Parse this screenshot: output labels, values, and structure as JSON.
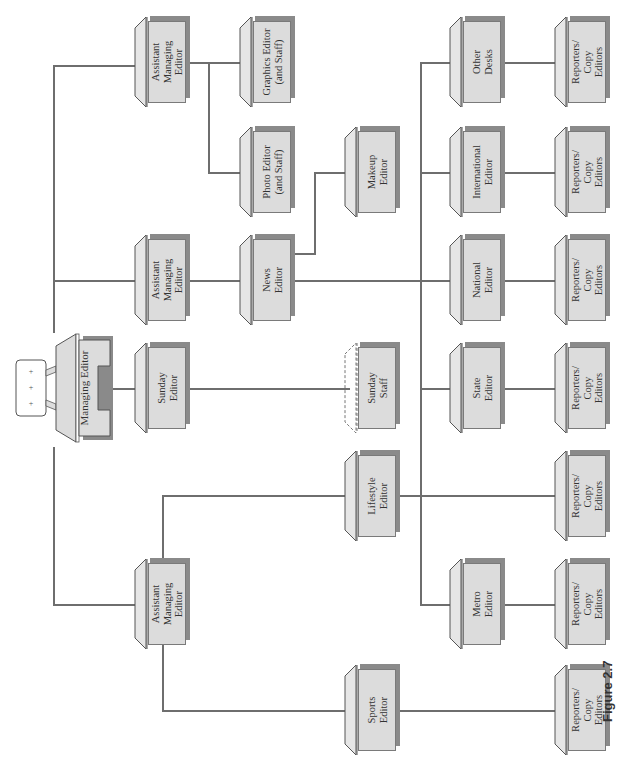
{
  "diagram": {
    "type": "org-chart",
    "orientation": "rotated-90-ccw",
    "figure_label": "Figure 2.7",
    "root": {
      "id": "managing-editor",
      "label": "Managing Editor",
      "icon": "desk-with-typewriter-icon"
    },
    "nodes": {
      "ame_top": "Assistant\nManaging\nEditor",
      "graphics": "Graphics Editor\n(and Staff)",
      "photo": "Photo Editor\n(and Staff)",
      "ame_mid": "Assistant\nManaging\nEditor",
      "news": "News\nEditor",
      "makeup": "Makeup\nEditor",
      "other_desks": "Other\nDesks",
      "international": "International\nEditor",
      "national": "National\nEditor",
      "state": "State\nEditor",
      "metro": "Metro\nEditor",
      "sunday": "Sunday\nEditor",
      "sunday_staff": "Sunday\nStaff",
      "ame_bot": "Assistant\nManaging\nEditor",
      "lifestyle": "Lifestyle\nEditor",
      "sports": "Sports\nEditor",
      "rep_other": "Reporters/\nCopy\nEditors",
      "rep_international": "Reporters/\nCopy\nEditors",
      "rep_national": "Reporters/\nCopy\nEditors",
      "rep_state": "Reporters/\nCopy\nEditors",
      "rep_lifestyle": "Reporters/\nCopy\nEditors",
      "rep_metro": "Reporters/\nCopy\nEditors",
      "rep_sports": "Reporters/\nCopy\nEditors"
    },
    "edges": [
      [
        "Managing Editor",
        "Assistant Managing Editor (top)"
      ],
      [
        "Managing Editor",
        "Assistant Managing Editor (middle)"
      ],
      [
        "Managing Editor",
        "Sunday Editor"
      ],
      [
        "Managing Editor",
        "Assistant Managing Editor (bottom)"
      ],
      [
        "Assistant Managing Editor (top)",
        "Graphics Editor (and Staff)"
      ],
      [
        "Assistant Managing Editor (top)",
        "Photo Editor (and Staff)"
      ],
      [
        "Assistant Managing Editor (middle)",
        "News Editor"
      ],
      [
        "News Editor",
        "Makeup Editor"
      ],
      [
        "News Editor",
        "Other Desks"
      ],
      [
        "News Editor",
        "International Editor"
      ],
      [
        "News Editor",
        "National Editor"
      ],
      [
        "News Editor",
        "State Editor"
      ],
      [
        "News Editor",
        "Metro Editor"
      ],
      [
        "Sunday Editor",
        "Sunday Staff"
      ],
      [
        "Assistant Managing Editor (bottom)",
        "Lifestyle Editor"
      ],
      [
        "Assistant Managing Editor (bottom)",
        "Sports Editor"
      ],
      [
        "Other Desks",
        "Reporters/Copy Editors"
      ],
      [
        "International Editor",
        "Reporters/Copy Editors"
      ],
      [
        "National Editor",
        "Reporters/Copy Editors"
      ],
      [
        "State Editor",
        "Reporters/Copy Editors"
      ],
      [
        "Lifestyle Editor",
        "Reporters/Copy Editors"
      ],
      [
        "Metro Editor",
        "Reporters/Copy Editors"
      ],
      [
        "Sports Editor",
        "Reporters/Copy Editors"
      ]
    ],
    "colors": {
      "box_face": "#dcdcdc",
      "box_shadow": "#8a8a8a",
      "line": "#6e6e6e",
      "text": "#333333"
    }
  }
}
